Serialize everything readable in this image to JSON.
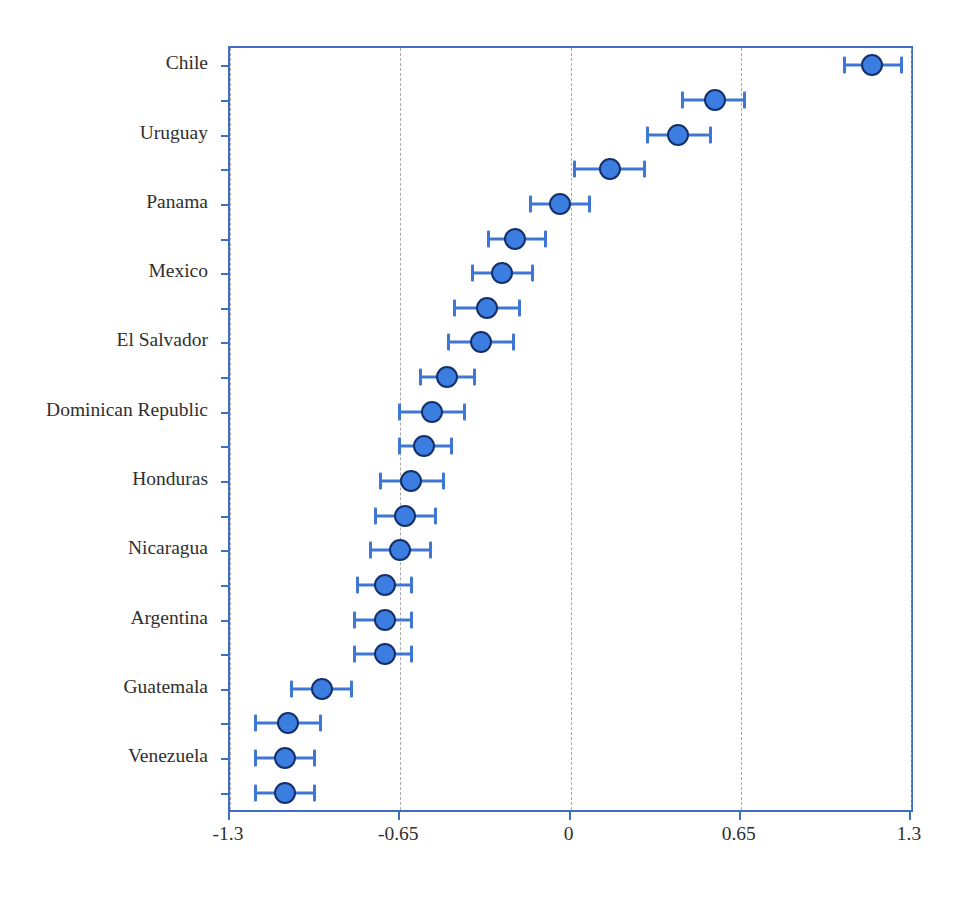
{
  "chart_data": {
    "type": "scatter",
    "subtype": "forest-plot-dot-and-whisker",
    "title": "",
    "xlabel": "",
    "ylabel": "",
    "xlim": [
      -1.3,
      1.3
    ],
    "xticks": [
      -1.3,
      -0.65,
      0,
      0.65,
      1.3
    ],
    "xticklabels": [
      "-1.3",
      "-0.65",
      "0",
      "0.65",
      "1.3"
    ],
    "grid": "vertical-dashed",
    "legend": "none",
    "marker_color": "#3b7de0",
    "marker_edge_color": "#14306b",
    "errorbar_color": "#3f76d4",
    "frame_color": "#3f6fc4",
    "gridline_color": "#9a9a9a",
    "n_points": 22,
    "ylabels_visible": [
      "Chile",
      "Uruguay",
      "Panama",
      "Mexico",
      "El Salvador",
      "Dominican Republic",
      "Honduras",
      "Nicaragua",
      "Argentina",
      "Guatemala",
      "Venezuela"
    ],
    "points": [
      {
        "index": 1,
        "label": "Chile",
        "value": 1.15,
        "low": 1.04,
        "high": 1.27
      },
      {
        "index": 2,
        "label": "",
        "value": 0.55,
        "low": 0.42,
        "high": 0.67
      },
      {
        "index": 3,
        "label": "Uruguay",
        "value": 0.41,
        "low": 0.29,
        "high": 0.54
      },
      {
        "index": 4,
        "label": "",
        "value": 0.15,
        "low": 0.01,
        "high": 0.29
      },
      {
        "index": 5,
        "label": "Panama",
        "value": -0.04,
        "low": -0.16,
        "high": 0.08
      },
      {
        "index": 6,
        "label": "",
        "value": -0.21,
        "low": -0.32,
        "high": -0.09
      },
      {
        "index": 7,
        "label": "Mexico",
        "value": -0.26,
        "low": -0.38,
        "high": -0.14
      },
      {
        "index": 8,
        "label": "",
        "value": -0.32,
        "low": -0.45,
        "high": -0.19
      },
      {
        "index": 9,
        "label": "El Salvador",
        "value": -0.34,
        "low": -0.47,
        "high": -0.21
      },
      {
        "index": 10,
        "label": "",
        "value": -0.47,
        "low": -0.58,
        "high": -0.36
      },
      {
        "index": 11,
        "label": "Dominican Republic",
        "value": -0.53,
        "low": -0.66,
        "high": -0.4
      },
      {
        "index": 12,
        "label": "",
        "value": -0.56,
        "low": -0.66,
        "high": -0.45
      },
      {
        "index": 13,
        "label": "Honduras",
        "value": -0.61,
        "low": -0.73,
        "high": -0.48
      },
      {
        "index": 14,
        "label": "",
        "value": -0.63,
        "low": -0.75,
        "high": -0.51
      },
      {
        "index": 15,
        "label": "Nicaragua",
        "value": -0.65,
        "low": -0.77,
        "high": -0.53
      },
      {
        "index": 16,
        "label": "",
        "value": -0.71,
        "low": -0.82,
        "high": -0.6
      },
      {
        "index": 17,
        "label": "Argentina",
        "value": -0.71,
        "low": -0.83,
        "high": -0.6
      },
      {
        "index": 18,
        "label": "",
        "value": -0.71,
        "low": -0.83,
        "high": -0.6
      },
      {
        "index": 19,
        "label": "Guatemala",
        "value": -0.95,
        "low": -1.07,
        "high": -0.83
      },
      {
        "index": 20,
        "label": "",
        "value": -1.08,
        "low": -1.21,
        "high": -0.95
      },
      {
        "index": 21,
        "label": "Venezuela",
        "value": -1.09,
        "low": -1.21,
        "high": -0.97
      },
      {
        "index": 22,
        "label": "",
        "value": -1.09,
        "low": -1.21,
        "high": -0.97
      }
    ]
  }
}
